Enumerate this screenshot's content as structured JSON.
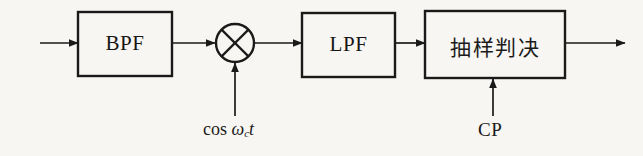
{
  "figure": {
    "kind": "signal-flow-block-diagram",
    "background_color": "#f7f6f2",
    "line_color": "#1a1a1a",
    "text_color": "#1a1a1a"
  },
  "blocks": [
    {
      "id": "bpf",
      "label": "BPF",
      "script": "latin",
      "x": 78,
      "y": 12,
      "w": 94,
      "h": 64
    },
    {
      "id": "lpf",
      "label": "LPF",
      "script": "latin",
      "x": 302,
      "y": 13,
      "w": 93,
      "h": 64
    },
    {
      "id": "decision",
      "label": "抽样判决",
      "script": "cjk",
      "x": 425,
      "y": 11,
      "w": 140,
      "h": 67
    }
  ],
  "mixer": {
    "id": "multiplier",
    "symbol": "cross-in-circle",
    "cx": 235,
    "cy": 43,
    "r": 19
  },
  "signal_line_y": 43,
  "arrows": [
    {
      "id": "input-arrow",
      "x1": 40,
      "y1": 43,
      "x2": 78,
      "y2": 43
    },
    {
      "id": "bpf-to-mixer",
      "x1": 172,
      "y1": 43,
      "x2": 216,
      "y2": 43
    },
    {
      "id": "mixer-to-lpf",
      "x1": 254,
      "y1": 43,
      "x2": 302,
      "y2": 43
    },
    {
      "id": "lpf-to-decision",
      "x1": 395,
      "y1": 43,
      "x2": 425,
      "y2": 43
    },
    {
      "id": "decision-to-output",
      "x1": 565,
      "y1": 43,
      "x2": 625,
      "y2": 43
    },
    {
      "id": "carrier-into-mixer",
      "x1": 235,
      "y1": 116,
      "x2": 235,
      "y2": 62
    },
    {
      "id": "cp-into-decision",
      "x1": 493,
      "y1": 116,
      "x2": 493,
      "y2": 78
    }
  ],
  "annotations": [
    {
      "id": "carrier-label",
      "parts": {
        "fn": "cos",
        "space": " ",
        "mi": "ω",
        "sub": "c",
        "var": "t"
      },
      "plain": "cos ωc t",
      "x": 203,
      "y": 119
    },
    {
      "id": "cp-label",
      "text": "CP",
      "x": 478,
      "y": 119
    }
  ]
}
